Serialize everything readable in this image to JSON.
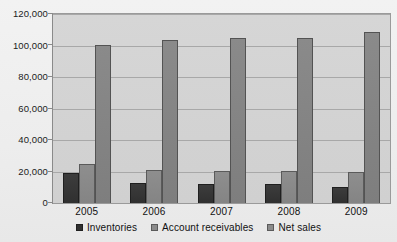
{
  "chart_data": {
    "type": "bar",
    "title": "",
    "subtitle": "",
    "xlabel": "",
    "ylabel": "",
    "categories": [
      "2005",
      "2006",
      "2007",
      "2008",
      "2009"
    ],
    "series": [
      {
        "name": "Inventories",
        "color": "#303030",
        "values": [
          19000,
          12500,
          12000,
          12000,
          10000
        ]
      },
      {
        "name": "Account receivables",
        "color": "#8b8b8b",
        "values": [
          24500,
          21000,
          20500,
          20500,
          20000
        ]
      },
      {
        "name": "Net sales",
        "color": "#8b8b8b",
        "values": [
          100500,
          103500,
          104500,
          104500,
          108500
        ]
      }
    ],
    "ylim": [
      0,
      120000
    ],
    "ytick_step": 20000,
    "ytick_labels": [
      "0",
      "20,000",
      "40,000",
      "60,000",
      "80,000",
      "100,000",
      "120,000"
    ],
    "ytick_values": [
      0,
      20000,
      40000,
      60000,
      80000,
      100000,
      120000
    ],
    "grid": true,
    "legend_position": "bottom",
    "plot_background": "#d2d2d2",
    "figure_background": "#efefef"
  }
}
